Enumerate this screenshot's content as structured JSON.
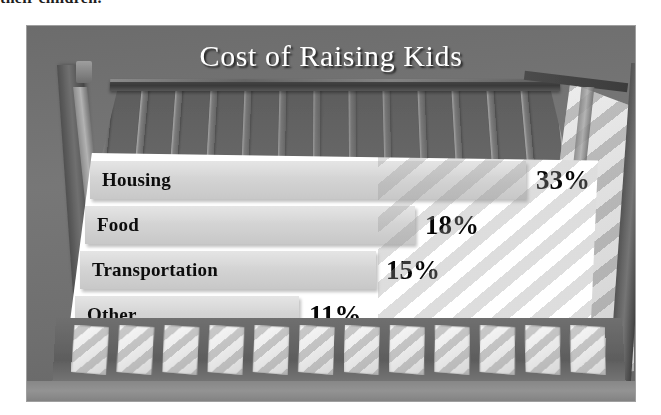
{
  "document": {
    "clipped_line_above_figure": "their children."
  },
  "figure": {
    "title": "Cost of Raising Kids",
    "scene": {
      "subject": "baby crib",
      "slat_count": 14,
      "front_gap_count": 12,
      "background_color": "#6f7277",
      "panel_color": "#fcfbfa",
      "bar_color": "#d2d1d0",
      "title_color": "#fdfdfc",
      "text_color": "#111111"
    }
  },
  "chart_data": {
    "type": "bar",
    "orientation": "horizontal",
    "title": "Cost of Raising Kids",
    "xlabel": "",
    "ylabel": "",
    "categories": [
      "Housing",
      "Food",
      "Transportation",
      "Other"
    ],
    "values": [
      33,
      18,
      15,
      11
    ],
    "value_labels": [
      "33%",
      "18%",
      "15%",
      "11%"
    ],
    "unit": "%",
    "xlim": [
      0,
      33
    ],
    "grid": false,
    "legend": false,
    "bars": [
      {
        "label": "Housing",
        "value": 33,
        "value_label": "33%",
        "bar_width_px": 436
      },
      {
        "label": "Food",
        "value": 18,
        "value_label": "18%",
        "bar_width_px": 330
      },
      {
        "label": "Transportation",
        "value": 15,
        "value_label": "15%",
        "bar_width_px": 296
      },
      {
        "label": "Other",
        "value": 11,
        "value_label": "11%",
        "bar_width_px": 224
      }
    ]
  }
}
